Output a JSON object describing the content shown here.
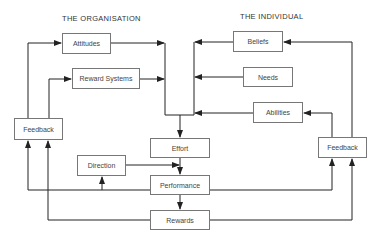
{
  "diagram": {
    "sections": {
      "organisation": "THE ORGANISATION",
      "individual": "THE INDIVIDUAL"
    },
    "nodes": {
      "attitudes": "Attitudes",
      "reward_systems": "Reward Systems",
      "feedback_left": "Feedback",
      "beliefs": "Beliefs",
      "needs": "Needs",
      "abilities": "Abilities",
      "feedback_right": "Feedback",
      "effort": "Effort",
      "direction": "Direction",
      "performance": "Performance",
      "rewards": "Rewards"
    },
    "edges": [
      {
        "from": "feedback_left",
        "to": "attitudes"
      },
      {
        "from": "feedback_left",
        "to": "reward_systems"
      },
      {
        "from": "attitudes",
        "to": "effort"
      },
      {
        "from": "reward_systems",
        "to": "effort"
      },
      {
        "from": "beliefs",
        "to": "effort"
      },
      {
        "from": "needs",
        "to": "effort"
      },
      {
        "from": "abilities",
        "to": "effort"
      },
      {
        "from": "feedback_right",
        "to": "beliefs"
      },
      {
        "from": "feedback_right",
        "to": "abilities"
      },
      {
        "from": "effort",
        "to": "performance"
      },
      {
        "from": "direction",
        "to": "performance"
      },
      {
        "from": "performance",
        "to": "rewards"
      },
      {
        "from": "performance",
        "to": "direction"
      },
      {
        "from": "performance",
        "to": "feedback_left"
      },
      {
        "from": "performance",
        "to": "feedback_right"
      },
      {
        "from": "rewards",
        "to": "feedback_left"
      },
      {
        "from": "rewards",
        "to": "feedback_right"
      }
    ],
    "colors": {
      "line": "#222222",
      "box_border": "#777777",
      "text": "#444444"
    }
  }
}
